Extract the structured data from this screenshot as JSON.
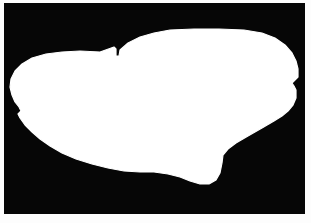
{
  "figure": {
    "kind": "binary-segmentation-mask",
    "subject_label": "car",
    "caption": "",
    "width_px": 311,
    "height_px": 223
  },
  "canvas": {
    "background_color": "#060606",
    "page_border_color": "#fdfdfd",
    "inset_left_px": 4,
    "inset_top_px": 3,
    "plate_width_px": 301,
    "plate_height_px": 211
  },
  "mask": {
    "foreground_color": "#ffffff",
    "background_color": "#060606",
    "region_count": 1,
    "bounds": {
      "min_x": 6,
      "min_y": 26,
      "max_x": 294,
      "max_y": 181
    },
    "outline_points": [
      [
        96,
        49
      ],
      [
        110,
        44
      ],
      [
        112,
        46
      ],
      [
        112,
        53
      ],
      [
        115,
        53
      ],
      [
        116,
        47
      ],
      [
        124,
        40
      ],
      [
        136,
        34
      ],
      [
        150,
        30
      ],
      [
        166,
        27
      ],
      [
        190,
        26
      ],
      [
        215,
        26
      ],
      [
        240,
        27
      ],
      [
        258,
        30
      ],
      [
        271,
        35
      ],
      [
        281,
        42
      ],
      [
        288,
        50
      ],
      [
        292,
        58
      ],
      [
        294,
        66
      ],
      [
        294,
        74
      ],
      [
        290,
        78
      ],
      [
        288,
        80
      ],
      [
        290,
        83
      ],
      [
        292,
        87
      ],
      [
        292,
        95
      ],
      [
        289,
        102
      ],
      [
        284,
        108
      ],
      [
        278,
        113
      ],
      [
        270,
        118
      ],
      [
        258,
        125
      ],
      [
        244,
        133
      ],
      [
        232,
        140
      ],
      [
        224,
        146
      ],
      [
        219,
        152
      ],
      [
        218,
        160
      ],
      [
        216,
        170
      ],
      [
        212,
        177
      ],
      [
        205,
        181
      ],
      [
        196,
        181
      ],
      [
        186,
        178
      ],
      [
        176,
        174
      ],
      [
        164,
        171
      ],
      [
        150,
        169
      ],
      [
        136,
        169
      ],
      [
        120,
        168
      ],
      [
        104,
        165
      ],
      [
        88,
        161
      ],
      [
        72,
        156
      ],
      [
        58,
        150
      ],
      [
        46,
        143
      ],
      [
        36,
        136
      ],
      [
        28,
        129
      ],
      [
        21,
        122
      ],
      [
        16,
        115
      ],
      [
        14,
        111
      ],
      [
        17,
        108
      ],
      [
        15,
        104
      ],
      [
        11,
        99
      ],
      [
        8,
        92
      ],
      [
        6,
        84
      ],
      [
        7,
        76
      ],
      [
        11,
        68
      ],
      [
        18,
        61
      ],
      [
        28,
        55
      ],
      [
        42,
        51
      ],
      [
        58,
        49
      ],
      [
        76,
        48
      ]
    ]
  }
}
